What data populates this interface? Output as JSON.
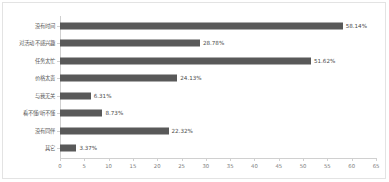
{
  "chart_data": {
    "type": "bar",
    "orientation": "horizontal",
    "title": "",
    "subtitle": "",
    "xlabel": "",
    "ylabel": "",
    "categories": [
      "没有时间",
      "对活动不感兴趣",
      "任务太忙",
      "价格太贵",
      "与我无关",
      "看不懂/听不懂",
      "没有同伴",
      "其它"
    ],
    "values": [
      58.14,
      28.78,
      51.62,
      24.13,
      6.31,
      8.73,
      22.32,
      3.37
    ],
    "value_labels": [
      "58.14%",
      "28.78%",
      "51.62%",
      "24.13%",
      "6.31%",
      "8.73%",
      "22.32%",
      "3.37%"
    ],
    "xlim": [
      0,
      65
    ],
    "xticks": [
      0,
      5,
      10,
      15,
      20,
      25,
      30,
      35,
      40,
      45,
      50,
      55,
      60,
      65
    ],
    "xtick_labels": [
      "0",
      "5",
      "10",
      "15",
      "20",
      "25",
      "30",
      "35",
      "40",
      "45",
      "50",
      "55",
      "60",
      "65"
    ],
    "grid": false,
    "legend": false,
    "bar_color": "#595959",
    "axis_color": "#d0d0d0",
    "label_color": "#595959",
    "tick_label_color": "#7a7a7a",
    "border_color": "#e3e3e3",
    "background": "#ffffff"
  }
}
